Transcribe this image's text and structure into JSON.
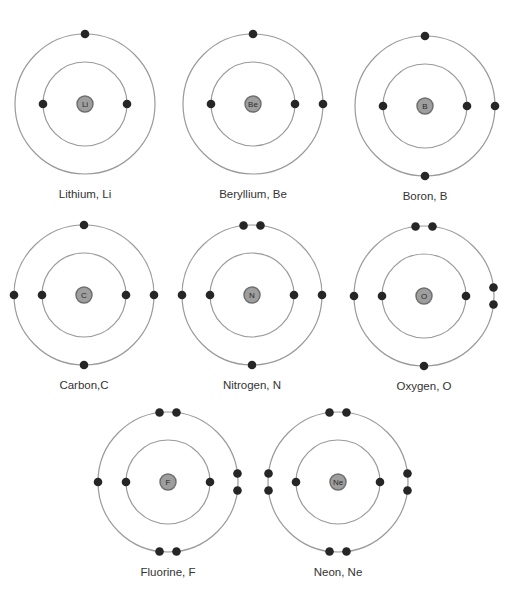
{
  "diagram": {
    "atoms": [
      {
        "name": "Lithium",
        "symbol": "Li",
        "caption": "Lithium, Li",
        "shells": [
          2,
          1
        ],
        "outer_layout": [
          "top"
        ]
      },
      {
        "name": "Beryllium",
        "symbol": "Be",
        "caption": "Beryllium, Be",
        "shells": [
          2,
          2
        ],
        "outer_layout": [
          "top",
          "right"
        ]
      },
      {
        "name": "Boron",
        "symbol": "B",
        "caption": "Boron, B",
        "shells": [
          2,
          3
        ],
        "outer_layout": [
          "top",
          "right",
          "bottom"
        ]
      },
      {
        "name": "Carbon",
        "symbol": "C",
        "caption": "Carbon,C",
        "shells": [
          2,
          4
        ],
        "outer_layout": [
          "top",
          "right",
          "bottom",
          "left"
        ]
      },
      {
        "name": "Nitrogen",
        "symbol": "N",
        "caption": "Nitrogen, N",
        "shells": [
          2,
          5
        ],
        "outer_layout": [
          "top-pair",
          "right",
          "bottom",
          "left"
        ]
      },
      {
        "name": "Oxygen",
        "symbol": "O",
        "caption": "Oxygen, O",
        "shells": [
          2,
          6
        ],
        "outer_layout": [
          "top-pair",
          "right-pair",
          "bottom",
          "left"
        ]
      },
      {
        "name": "Fluorine",
        "symbol": "F",
        "caption": "Fluorine, F",
        "shells": [
          2,
          7
        ],
        "outer_layout": [
          "top-pair",
          "right-pair",
          "bottom-pair",
          "left"
        ]
      },
      {
        "name": "Neon",
        "symbol": "Ne",
        "caption": "Neon, Ne",
        "shells": [
          2,
          8
        ],
        "outer_layout": [
          "top-pair",
          "right-pair",
          "bottom-pair",
          "left-pair"
        ]
      }
    ],
    "colors": {
      "orbit": "#9a9a9a",
      "electron": "#262626",
      "nucleus_fill": "#9e9e9e",
      "nucleus_stroke": "#6f6f6f",
      "caption": "#333333"
    }
  }
}
